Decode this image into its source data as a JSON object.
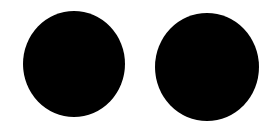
{
  "canvas": {
    "width": 280,
    "height": 131,
    "background": "#ffffff"
  },
  "shapes": [
    {
      "type": "circle",
      "cx": 74,
      "cy": 64,
      "rx": 51,
      "ry": 53,
      "fill": "#000000"
    },
    {
      "type": "circle",
      "cx": 207,
      "cy": 67,
      "rx": 52,
      "ry": 54,
      "fill": "#000000"
    }
  ]
}
